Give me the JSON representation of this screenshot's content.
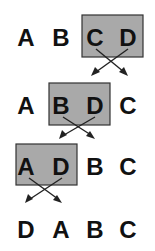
{
  "title": "",
  "rows": [
    {
      "letters": [
        "A",
        "B",
        "C",
        "D"
      ],
      "swap_positions": [
        3,
        4
      ]
    },
    {
      "letters": [
        "A",
        "B",
        "D",
        "C"
      ],
      "swap_positions": [
        2,
        3
      ]
    },
    {
      "letters": [
        "A",
        "D",
        "B",
        "C"
      ],
      "swap_positions": [
        1,
        2
      ]
    },
    {
      "letters": [
        "D",
        "A",
        "B",
        "C"
      ],
      "swap_positions": []
    }
  ],
  "colors": {
    "highlight_box": "#a9a9a9",
    "text": "#111111",
    "arrow": "#222222"
  }
}
